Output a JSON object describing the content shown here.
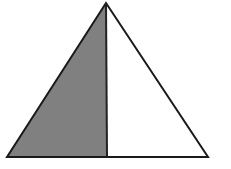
{
  "figure": {
    "canvas": {
      "width": 231,
      "height": 169,
      "background": "#ffffff"
    },
    "colors": {
      "shaded_fill": "#808080",
      "unshaded_fill": "#ffffff",
      "outline": "#1a1a1a",
      "divider": "#222222",
      "background": "#ffffff"
    },
    "stroke": {
      "outline_width": 2,
      "divider_width": 2
    },
    "vertices": {
      "apex": {
        "label": "apex",
        "x": 106,
        "y": 3
      },
      "bottom_left": {
        "label": "bottom-left",
        "x": 7,
        "y": 157
      },
      "bottom_right": {
        "label": "bottom-right",
        "x": 208,
        "y": 157
      },
      "divider_foot": {
        "label": "divider-foot",
        "x": 107,
        "y": 157
      }
    },
    "regions": [
      {
        "name": "left-shaded-region",
        "shading": "shaded",
        "fill": "#808080",
        "points": "106,3 7,157 107,157"
      },
      {
        "name": "right-unshaded-region",
        "shading": "unshaded",
        "fill": "#ffffff",
        "points": "106,3 107,157 208,157"
      }
    ],
    "outline_path": "106,3 7,157 208,157",
    "divider_line": {
      "x1": 106,
      "y1": 3,
      "x2": 107,
      "y2": 157
    },
    "labels": []
  }
}
